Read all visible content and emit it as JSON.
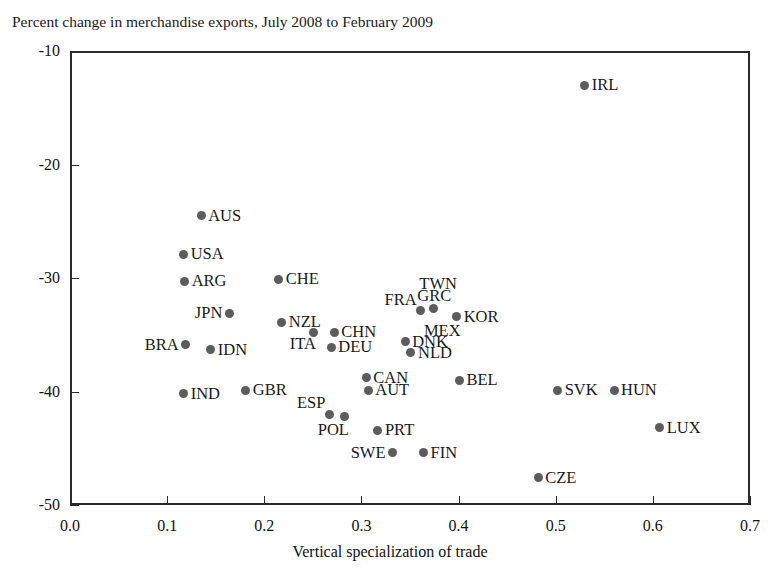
{
  "chart": {
    "title": "Percent change in merchandise exports, July 2008 to February 2009",
    "xlabel": "Vertical specialization of trade",
    "ylabel": ""
  },
  "axes": {
    "x_ticks": [
      "0.0",
      "0.1",
      "0.2",
      "0.3",
      "0.4",
      "0.5",
      "0.6",
      "0.7"
    ],
    "y_ticks": [
      "-10",
      "-20",
      "-30",
      "-40",
      "-50"
    ]
  },
  "chart_data": {
    "type": "scatter",
    "title": "Percent change in merchandise exports, July 2008 to February 2009",
    "xlabel": "Vertical specialization of trade",
    "ylabel": "Percent change in merchandise exports, July 2008 to February 2009",
    "xlim": [
      0.0,
      0.7
    ],
    "ylim": [
      -50,
      -10
    ],
    "xticks": [
      0.0,
      0.1,
      0.2,
      0.3,
      0.4,
      0.5,
      0.6,
      0.7
    ],
    "yticks": [
      -10,
      -20,
      -30,
      -40,
      -50
    ],
    "grid": false,
    "legend": null,
    "marker": {
      "shape": "circle",
      "color": "#5c5c5c",
      "size": 9
    },
    "points": [
      {
        "label": "IRL",
        "x": 0.53,
        "y": -13.0,
        "lpos": "r"
      },
      {
        "label": "AUS",
        "x": 0.135,
        "y": -24.5,
        "lpos": "r"
      },
      {
        "label": "USA",
        "x": 0.117,
        "y": -27.9,
        "lpos": "r"
      },
      {
        "label": "ARG",
        "x": 0.118,
        "y": -30.3,
        "lpos": "r"
      },
      {
        "label": "CHE",
        "x": 0.215,
        "y": -30.1,
        "lpos": "r"
      },
      {
        "label": "JPN",
        "x": 0.164,
        "y": -33.1,
        "lpos": "l"
      },
      {
        "label": "NZL",
        "x": 0.218,
        "y": -33.9,
        "lpos": "r"
      },
      {
        "label": "ITA",
        "x": 0.251,
        "y": -34.8,
        "lpos": "bl"
      },
      {
        "label": "BRA",
        "x": 0.119,
        "y": -35.9,
        "lpos": "l"
      },
      {
        "label": "IDN",
        "x": 0.145,
        "y": -36.3,
        "lpos": "r"
      },
      {
        "label": "FRA",
        "x": 0.361,
        "y": -32.9,
        "lpos": "al"
      },
      {
        "label": "GRC",
        "x": 0.374,
        "y": -32.7,
        "lpos": "al2"
      },
      {
        "label": "KOR",
        "x": 0.398,
        "y": -33.4,
        "lpos": "r"
      },
      {
        "label": "TWN",
        "x": 0.374,
        "y": -32.7,
        "lpos": "above"
      },
      {
        "label": "CHN",
        "x": 0.272,
        "y": -34.8,
        "lpos": "r"
      },
      {
        "label": "DEU",
        "x": 0.269,
        "y": -36.1,
        "lpos": "r"
      },
      {
        "label": "MEX",
        "x": 0.398,
        "y": -33.4,
        "lpos": "below"
      },
      {
        "label": "DNK",
        "x": 0.345,
        "y": -35.6,
        "lpos": "r"
      },
      {
        "label": "NLD",
        "x": 0.351,
        "y": -36.6,
        "lpos": "r"
      },
      {
        "label": "CAN",
        "x": 0.305,
        "y": -38.8,
        "lpos": "r"
      },
      {
        "label": "AUT",
        "x": 0.307,
        "y": -39.9,
        "lpos": "r"
      },
      {
        "label": "IND",
        "x": 0.117,
        "y": -40.2,
        "lpos": "r"
      },
      {
        "label": "GBR",
        "x": 0.181,
        "y": -39.9,
        "lpos": "r"
      },
      {
        "label": "BEL",
        "x": 0.401,
        "y": -39.0,
        "lpos": "r"
      },
      {
        "label": "SVK",
        "x": 0.502,
        "y": -39.9,
        "lpos": "r"
      },
      {
        "label": "HUN",
        "x": 0.56,
        "y": -39.9,
        "lpos": "r"
      },
      {
        "label": "ESP",
        "x": 0.267,
        "y": -42.0,
        "lpos": "al"
      },
      {
        "label": "POL",
        "x": 0.283,
        "y": -42.2,
        "lpos": "below"
      },
      {
        "label": "PRT",
        "x": 0.317,
        "y": -43.4,
        "lpos": "r"
      },
      {
        "label": "LUX",
        "x": 0.607,
        "y": -43.2,
        "lpos": "r"
      },
      {
        "label": "SWE",
        "x": 0.332,
        "y": -45.4,
        "lpos": "l"
      },
      {
        "label": "FIN",
        "x": 0.364,
        "y": -45.4,
        "lpos": "r"
      },
      {
        "label": "CZE",
        "x": 0.482,
        "y": -47.6,
        "lpos": "r"
      }
    ]
  }
}
